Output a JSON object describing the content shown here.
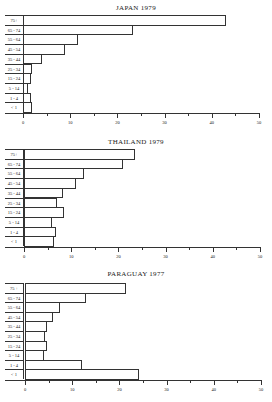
{
  "chart_data": [
    {
      "type": "bar",
      "orientation": "horizontal",
      "title": "JAPAN  1979",
      "categories": [
        "75+",
        "65 - 74",
        "55 - 64",
        "45 - 54",
        "35 - 44",
        "25 - 34",
        "15 - 24",
        "5 - 14",
        "1 - 4",
        "< 1"
      ],
      "values": [
        43,
        23.3,
        11.7,
        8.9,
        4.0,
        2.0,
        1.6,
        1.1,
        1.6,
        2.0
      ],
      "xlabel": "",
      "ylabel": "",
      "xlim": [
        0,
        50
      ],
      "xticks": [
        "0",
        "10",
        "20",
        "30",
        "40",
        "50"
      ],
      "grid": false
    },
    {
      "type": "bar",
      "orientation": "horizontal",
      "title": "THAILAND  1979",
      "categories": [
        "75+",
        "65 - 74",
        "55 - 64",
        "45 - 54",
        "35 - 44",
        "25 - 34",
        "15 - 24",
        "5 - 14",
        "1 - 4",
        "< 1"
      ],
      "values": [
        23.5,
        21.0,
        12.7,
        11.0,
        8.2,
        7.0,
        8.5,
        6.0,
        6.8,
        6.3
      ],
      "xlabel": "",
      "ylabel": "",
      "xlim": [
        0,
        50
      ],
      "xticks": [
        "0",
        "10",
        "20",
        "30",
        "40",
        "50"
      ],
      "grid": false
    },
    {
      "type": "bar",
      "orientation": "horizontal",
      "title": "PARAGUAY  1977",
      "categories": [
        "75 +",
        "65 - 74",
        "55 - 64",
        "45 - 54",
        "35 - 44",
        "25 - 34",
        "15 - 24",
        "5 - 14",
        "1 - 4",
        "< 1"
      ],
      "values": [
        21.5,
        13.0,
        7.5,
        6.0,
        4.6,
        4.2,
        4.6,
        4.0,
        12.0,
        24.2
      ],
      "xlabel": "",
      "ylabel": "",
      "xlim": [
        0,
        50
      ],
      "xticks": [
        "0",
        "10",
        "20",
        "30",
        "40",
        "50"
      ],
      "grid": false
    }
  ],
  "charts": [
    {
      "title": "JAPAN  1979"
    },
    {
      "title": "THAILAND  1979"
    },
    {
      "title": "PARAGUAY  1977"
    }
  ]
}
